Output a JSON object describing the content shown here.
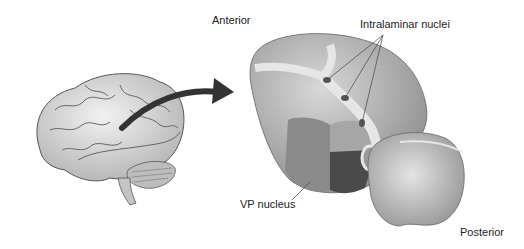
{
  "diagram": {
    "labels": {
      "anterior": "Anterior",
      "intralaminar": "Intralaminar nuclei",
      "vp_nucleus": "VP nucleus",
      "posterior": "Posterior"
    },
    "colors": {
      "background": "#ffffff",
      "thalamus_light": "#c8c8c8",
      "thalamus_mid": "#9a9a9a",
      "thalamus_dark": "#4a4a4a",
      "lamina": "#e6e6e6",
      "arrow": "#333333",
      "text": "#222222"
    }
  }
}
